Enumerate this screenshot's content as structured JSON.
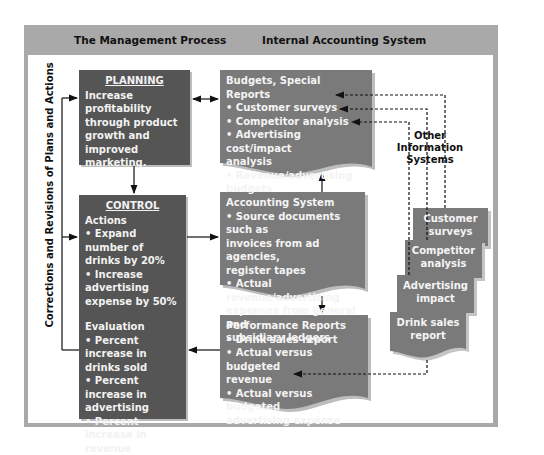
{
  "headers": {
    "left": "The Management Process",
    "right": "Internal Accounting System"
  },
  "side_label": "Corrections and Revisions of Plans and Actions",
  "planning": {
    "title": "PLANNING",
    "lines": [
      "Increase profitability",
      "through product",
      "growth and improved",
      "marketing."
    ]
  },
  "control": {
    "title": "CONTROL",
    "actions_heading": "Actions",
    "actions": [
      "• Expand number of",
      "drinks by 20%",
      "• Increase advertising",
      "expense by 50%"
    ],
    "evaluation_heading": "Evaluation",
    "evaluation": [
      "• Percent increase in",
      "drinks sold",
      "• Percent increase in",
      "advertising",
      "• Percent increase in",
      "revenue"
    ]
  },
  "budgets": {
    "title": "Budgets, Special Reports",
    "lines": [
      "• Customer surveys",
      "• Competitor analysis",
      "• Advertising cost/impact",
      "analysis",
      "• Revenue/advertising",
      "budgets"
    ]
  },
  "accounting": {
    "title": "Accounting System",
    "lines": [
      "• Source documents such as",
      "invoices from ad agencies,",
      "register tapes",
      "• Actual revenue/advertising",
      "expenses from general and",
      "subsidiary ledgers"
    ]
  },
  "performance": {
    "title": "Performance Reports",
    "lines": [
      "• Drink sales report",
      "• Actual versus budgeted",
      "revenue",
      "• Actual versus budgeted",
      "advertising expense"
    ]
  },
  "other_systems": {
    "title_line1": "Other Information",
    "title_line2": "Systems",
    "documents": [
      {
        "line1": "Customer",
        "line2": "surveys"
      },
      {
        "line1": "Competitor",
        "line2": "analysis"
      },
      {
        "line1": "Advertising",
        "line2": "impact"
      },
      {
        "line1": "Drink sales",
        "line2": "report"
      }
    ]
  },
  "colors": {
    "frame": "#a9a9a9",
    "dark_box": "#555555",
    "doc_fill": "#7a7a7a",
    "text_light": "#f2f2f2"
  }
}
